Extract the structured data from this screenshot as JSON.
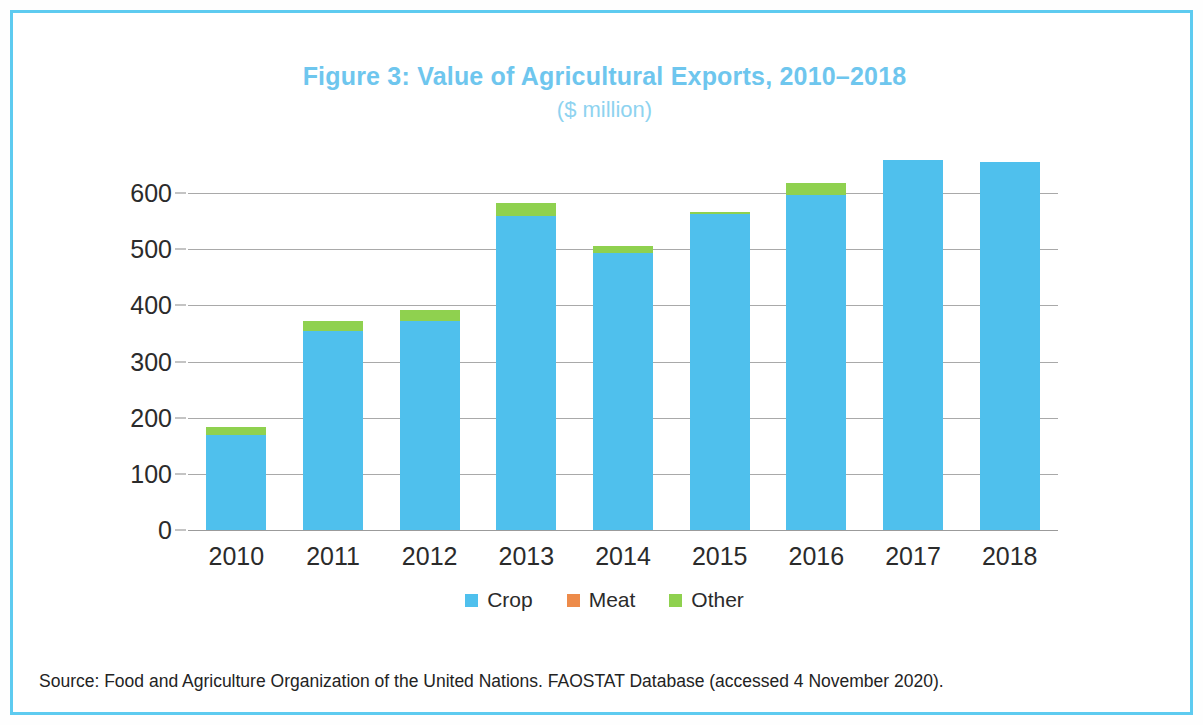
{
  "figure": {
    "title": "Figure 3: Value of Agricultural Exports, 2010–2018",
    "subtitle": "($ million)",
    "source": "Source: Food and Agriculture Organization of the United Nations. FAOSTAT Database (accessed 4 November 2020).",
    "title_color": "#6ec6ee",
    "subtitle_color": "#8ed3f0",
    "frame_color": "#5ecbf0"
  },
  "chart_data": {
    "type": "bar",
    "stacked": true,
    "title": "Figure 3: Value of Agricultural Exports, 2010–2018",
    "subtitle": "($ million)",
    "xlabel": "",
    "ylabel": "",
    "ylim": [
      0,
      650
    ],
    "yticks": [
      0,
      100,
      200,
      300,
      400,
      500,
      600
    ],
    "ytick_labels": [
      "0",
      "100",
      "200",
      "300",
      "400",
      "500",
      "600"
    ],
    "grid": true,
    "legend_position": "bottom",
    "categories": [
      "2010",
      "2011",
      "2012",
      "2013",
      "2014",
      "2015",
      "2016",
      "2017",
      "2018"
    ],
    "series": [
      {
        "name": "Crop",
        "color": "#4fc0ed",
        "values": [
          170,
          355,
          372,
          559,
          494,
          562,
          597,
          658,
          656
        ]
      },
      {
        "name": "Meat",
        "color": "#ed8b4a",
        "values": [
          0,
          0,
          0,
          0,
          0,
          0,
          0,
          0,
          0
        ]
      },
      {
        "name": "Other",
        "color": "#8fd14f",
        "values": [
          14,
          18,
          20,
          23,
          11,
          4,
          20,
          0,
          0
        ]
      }
    ],
    "totals": [
      184,
      373,
      392,
      582,
      505,
      566,
      617,
      658,
      656
    ]
  },
  "legend": [
    {
      "label": "Crop",
      "color": "#4fc0ed"
    },
    {
      "label": "Meat",
      "color": "#ed8b4a"
    },
    {
      "label": "Other",
      "color": "#8fd14f"
    }
  ]
}
